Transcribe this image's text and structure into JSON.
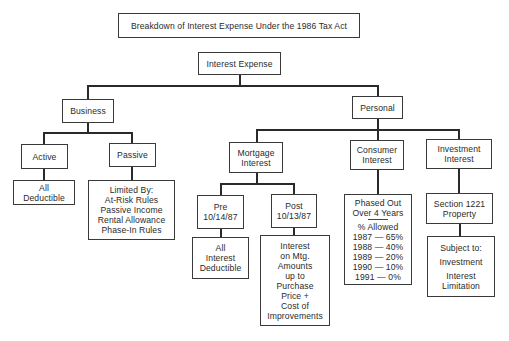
{
  "title": "Breakdown of Interest Expense Under the 1986 Tax Act",
  "root": {
    "label": "Interest Expense"
  },
  "business": {
    "label": "Business",
    "active": {
      "label": "Active",
      "detail": [
        "All",
        "Deductible"
      ]
    },
    "passive": {
      "label": "Passive",
      "detail": [
        "Limited By:",
        "At-Risk Rules",
        "Passive Income",
        "Rental Allowance",
        "Phase-In Rules"
      ]
    }
  },
  "personal": {
    "label": "Personal",
    "mortgage": {
      "label": [
        "Mortgage",
        "Interest"
      ],
      "pre": {
        "label": [
          "Pre",
          "10/14/87"
        ],
        "detail": [
          "All",
          "Interest",
          "Deductible"
        ]
      },
      "post": {
        "label": [
          "Post",
          "10/13/87"
        ],
        "detail": [
          "Interest",
          "on Mtg.",
          "Amounts",
          "up to",
          "Purchase",
          "Price +",
          "Cost of",
          "Improvements"
        ]
      }
    },
    "consumer": {
      "label": [
        "Consumer",
        "Interest"
      ],
      "detail_header": [
        "Phased Out",
        "Over 4 Years"
      ],
      "allowed_label": "% Allowed",
      "schedule": [
        "1987 — 65%",
        "1988 — 40%",
        "1989 — 20%",
        "1990 — 10%",
        "1991 — 0%"
      ]
    },
    "investment": {
      "label": [
        "Investment",
        "Interest"
      ],
      "property": [
        "Section 1221",
        "Property"
      ],
      "detail": [
        "Subject to:",
        "Investment",
        "Interest",
        "Limitation"
      ]
    }
  }
}
